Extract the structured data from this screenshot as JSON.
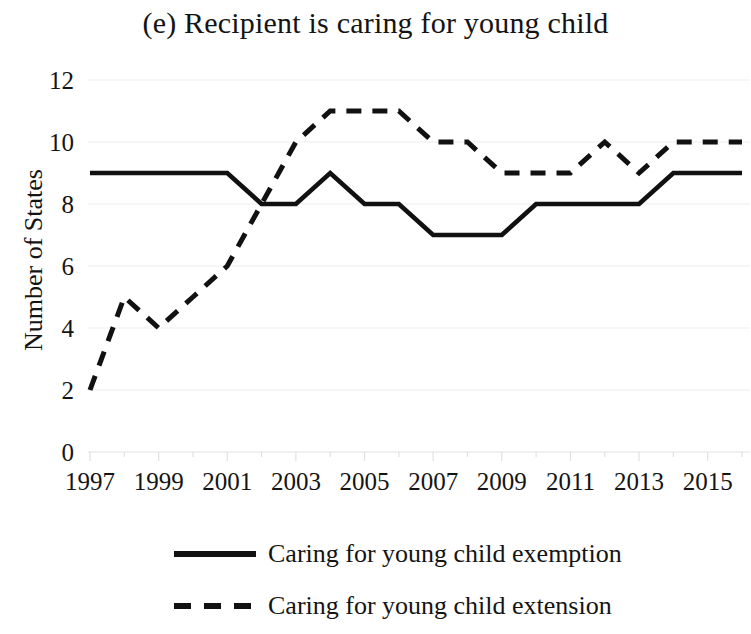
{
  "chart_data": {
    "type": "line",
    "title": "(e) Recipient is caring for young child",
    "xlabel": "",
    "ylabel": "Number of States",
    "xlim": [
      1996.5,
      2016.5
    ],
    "ylim": [
      0,
      12
    ],
    "yticks": [
      0,
      2,
      4,
      6,
      8,
      10,
      12
    ],
    "xticks": [
      1997,
      1999,
      2001,
      2003,
      2005,
      2007,
      2009,
      2011,
      2013,
      2015
    ],
    "x": [
      1997,
      1998,
      1999,
      2000,
      2001,
      2002,
      2003,
      2004,
      2005,
      2006,
      2007,
      2008,
      2009,
      2010,
      2011,
      2012,
      2013,
      2014,
      2015,
      2016
    ],
    "grid": true,
    "legend_position": "below",
    "series": [
      {
        "name": "Caring for young child exemption",
        "style": "solid",
        "color": "#111111",
        "values": [
          9,
          9,
          9,
          9,
          9,
          8,
          8,
          9,
          8,
          8,
          7,
          7,
          7,
          8,
          8,
          8,
          8,
          9,
          9,
          9
        ]
      },
      {
        "name": "Caring for young child extension",
        "style": "dashed",
        "color": "#111111",
        "values": [
          2,
          5,
          4,
          5,
          6,
          8,
          10,
          11,
          11,
          11,
          10,
          10,
          9,
          9,
          9,
          10,
          9,
          10,
          10,
          10
        ]
      }
    ]
  },
  "axis": {
    "y_title": "Number of States",
    "y_tick_labels": [
      "0",
      "2",
      "4",
      "6",
      "8",
      "10",
      "12"
    ],
    "x_tick_labels": [
      "1997",
      "1999",
      "2001",
      "2003",
      "2005",
      "2007",
      "2009",
      "2011",
      "2013",
      "2015"
    ]
  },
  "legend": {
    "items": [
      {
        "label": "Caring for young child exemption",
        "style": "solid"
      },
      {
        "label": "Caring for young child extension",
        "style": "dashed"
      }
    ]
  }
}
